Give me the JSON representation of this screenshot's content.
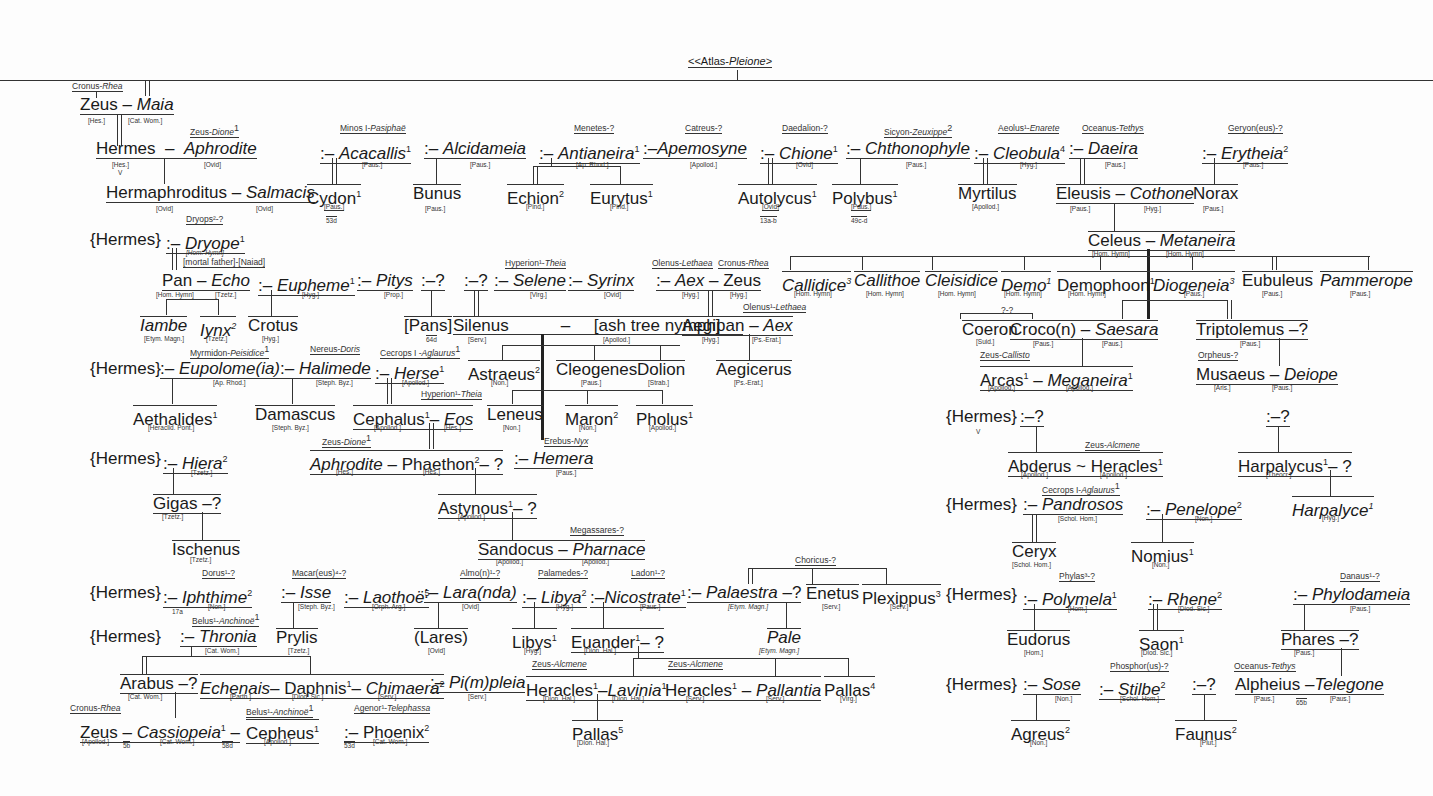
{
  "title": {
    "prefix": "<<Atlas-",
    "italic": "Pleione",
    "suffix": ">"
  },
  "nodes": {
    "cronus_rhea_1": "Cronus-",
    "rhea_1": "Rhea",
    "zeus_1": "Zeus",
    "maia": "Maia",
    "src_hes_1": "[Hes.]",
    "src_catwom_1": "[Cat. Wom.]",
    "zeus_dione_1": "Zeus-",
    "dione_1": "Dione",
    "hermes": "Hermes",
    "aphrodite_1": "Aphrodite",
    "src_hes_2": "[Hes.]",
    "src_ovid_1": "[Ovid]",
    "v_1": "V",
    "hermaphroditus": "Hermaphroditus",
    "salmacis": "Salmacis",
    "src_ovid_2": "[Ovid]",
    "src_ovid_3": "[Ovid]",
    "minos_pasiphae": "Minos I-",
    "pasiphae": "Pasiphaë",
    "acacallis": "Acacallis",
    "src_paus_1": "[Paus.]",
    "cydon": "Cydon",
    "src_paus_2": "[Paus.]",
    "ref_53d_1": "53d",
    "alcidameia": "Alcidameia",
    "src_paus_3": "[Paus.]",
    "bunus": "Bunus",
    "src_paus_4": "[Paus.]",
    "menetes": "Menetes-?",
    "antianeira": "Antianeira",
    "src_aprhod_1": "[Ap. Rhod.]",
    "echion": "Echion",
    "src_pind_1": "[Pind.]",
    "eurytus": "Eurytus",
    "src_pind_2": "[Pind.]",
    "catreus": "Catreus-?",
    "apemosyne": "Apemosyne",
    "src_apollod_1": "[Apollod.]",
    "daedalion": "Daedalion-?",
    "chione": "Chione",
    "src_ovid_4": "[Ovid]",
    "autolycus": "Autolycus",
    "src_ovid_5": "[Ovid]",
    "ref_13ab": "13a-b",
    "sicyon": "Sicyon-",
    "zeuxippe": "Zeuxippe",
    "chthonophyle": "Chthonophyle",
    "src_paus_5": "[Paus.]",
    "polybus": "Polybus",
    "src_paus_6": "[Paus.]",
    "ref_49cd": "49c-d",
    "aeolus": "Aeolus¹-",
    "enarete": "Enarete",
    "cleobula": "Cleobula",
    "src_hyg_1": "[Hyg.]",
    "myrtilus": "Myrtilus",
    "src_apollod_2": "[Apollod.]",
    "oceanus_1": "Oceanus-",
    "tethys_1": "Tethys",
    "daeira": "Daeira",
    "src_paus_7": "[Paus.]",
    "eleusis": "Eleusis",
    "cothone": "Cothone",
    "src_paus_8": "[Paus.]",
    "src_hyg_2": "[Hyg.]",
    "geryon": "Geryon(eus)-?",
    "erytheia": "Erytheia",
    "src_paus_9": "[Paus.]",
    "norax": "Norax",
    "src_paus_10": "[Paus.]",
    "celeus": "Celeus",
    "metaneira": "Metaneira",
    "src_homhym_1": "[Hom. Hymn]",
    "src_homhym_2": "[Hom. Hymn]",
    "callidice": "Callidice",
    "callithoe": "Callithoe",
    "cleisidice": "Cleisidice",
    "demo": "Demo",
    "demophoon": "Demophoon",
    "diogeneia": "Diogeneia",
    "eubuleus": "Eubuleus",
    "pammerope": "Pammerope",
    "src_homhym_3": "[Hom. Hymn]",
    "src_homhym_4": "[Hom. Hymn]",
    "src_homhym_5": "[Hom. Hymn]",
    "src_homhym_6": "[Hom. Hymn]",
    "src_homhym_7": "[Hom. Hymn]",
    "src_paus_11": "[Paus.]",
    "src_paus_12": "[Paus.]",
    "src_paus_13": "[Paus.]",
    "unk_pair": "?-?",
    "coeron": "Coeron",
    "src_suid": "[Suid.]",
    "croco": "Croco(n)",
    "saesara": "Saesara",
    "src_paus_14": "[Paus.]",
    "src_paus_15": "[Paus.]",
    "triptolemus": "Triptolemus",
    "q_1": "?",
    "src_paus_16": "[Paus.]",
    "zeus_callisto": "Zeus-",
    "callisto": "Callisto",
    "arcas": "Arcas",
    "meganeira": "Meganeira",
    "src_apollod_3": "[Apollod.]",
    "src_apollod_4": "[Apollod.]",
    "orpheus": "Orpheus-?",
    "musaeus": "Musaeus",
    "deiope": "Deiope",
    "src_aris": "[Aris.]",
    "src_paus_17": "[Paus.]",
    "hermes_b1": "{Hermes}",
    "dryops": "Dryops²-?",
    "dryope": "Dryope",
    "src_homhym_8": "[Hom. Hymn]",
    "mortal_naiad": "[mortal father]-[Naiad]",
    "pan": "Pan",
    "echo": "Echo",
    "src_homhym_9": "[Hom. Hymn]",
    "src_tzetz_1": "[Tzetz.]",
    "iambe": "Iambe",
    "src_etym_1": "[Etym. Magn.]",
    "iynx": "Iynx",
    "src_tzetz_2": "[Tzetz.]",
    "eupheme": "Eupheme",
    "src_hyg_3": "[Hyg.]",
    "crotus": "Crotus",
    "src_hyg_4": "[Hyg.]",
    "pitys": "Pitys",
    "src_prop": "[Prop.]",
    "q_2": "?",
    "pans": "[Pans]",
    "ref_64d": "64d",
    "q_3": "?",
    "hyperion_1": "Hyperion¹-",
    "theia_1": "Theia",
    "selene": "Selene",
    "src_virg_1": "[Virg.]",
    "syrinx": "Syrinx",
    "src_ovid_6": "[Ovid]",
    "silenus": "Silenus",
    "src_serv_1": "[Serv.]",
    "ash_nymph": "[ash tree nymph]",
    "src_apollod_5": "[Apollod.]",
    "olenus_1": "Olenus-",
    "lethaea_1": "Lethaea",
    "cronus_rhea_2": "Cronus-",
    "rhea_2": "Rhea",
    "aex_1": "Aex",
    "zeus_2": "Zeus",
    "src_hyg_5": "[Hyg.]",
    "src_hyg_6": "[Hyg.]",
    "olenus_2": "Olenus¹-",
    "lethaea_2": "Lethaea",
    "aegipan": "Aegipan",
    "aex_2": "Aex",
    "src_hyg_7": "[Hyg.]",
    "src_pserat_1": "[Ps.-Erat.]",
    "aegicerus": "Aegicerus",
    "src_pserat_2": "[Ps.-Erat.]",
    "astraeus": "Astraeus",
    "src_non_1": "[Non.]",
    "cleogenes": "Cleogenes",
    "src_paus_18": "[Paus.]",
    "dolion": "Dolion",
    "src_strab": "[Strab.]",
    "leneus": "Leneus",
    "src_non_2": "[Non.]",
    "maron": "Maron",
    "src_non_3": "[Non.]",
    "pholus": "Pholus",
    "src_apollod_6": "[Apollod.]",
    "hermes_b2": "{Hermes}",
    "myrmidon": "Myrmidon-",
    "peisidice": "Peisidice",
    "eupolomeia": "Eupolome(ia)",
    "src_aprhod_2": "[Ap. Rhod.]",
    "nereus": "Nereus-",
    "doris": "Doris",
    "halimede": "Halimede",
    "src_stephbyz_1": "[Steph. Byz.]",
    "cecrops_1": "Cecrops I -",
    "aglaurus_1": "Aglaurus",
    "herse": "Herse",
    "src_apollod_7": "[Apollod.]",
    "aethalides": "Aethalides",
    "src_heraclid": "[Heraclid. Pont.]",
    "damascus": "Damascus",
    "src_stephbyz_2": "[Steph. Byz.]",
    "hyperion_2": "Hyperion¹-",
    "theia_2": "Theia",
    "cephalus": "Cephalus",
    "eos": "Eos",
    "src_apollod_8": "[Apollod.]",
    "src_hes_3": "[Hes.]",
    "hermes_b3": "{Hermes}",
    "hiera": "Hiera",
    "src_tzetz_3": "[Tzetz.]",
    "zeus_dione_2": "Zeus-",
    "dione_2": "Dione",
    "aphrodite_2": "Aphrodite",
    "phaethon": "Phaethon",
    "q_4": "?",
    "src_hes_4": "[Hes.]",
    "src_hes_5": "[Hes.]",
    "erebus": "Erebus-",
    "nyx": "Nyx",
    "hemera": "Hemera",
    "src_paus_19": "[Paus.]",
    "gigas": "Gigas",
    "q_5": "?",
    "src_tzetz_4": "[Tzetz.]",
    "ischenus": "Ischenus",
    "src_tzetz_5": "[Tzetz.]",
    "astynous": "Astynous",
    "q_6": "?",
    "src_apollod_9": "[Apollod.]",
    "megassares": "Megassares-?",
    "sandocus": "Sandocus",
    "pharnace": "Pharnace",
    "src_apollod_10": "[Apollod.]",
    "src_apollod_11": "[Apollod.]",
    "hermes_b4": "{Hermes}",
    "dorus": "Dorus¹-?",
    "iphthime": "Iphthime",
    "src_non_4": "[Non.]",
    "ref_17a": "17a",
    "macareus": "Macar(eus)⁴-?",
    "isse": "Isse",
    "src_stephbyz_3": "[Steph. Byz.]",
    "laothoe": "Laothoë",
    "src_orpharg": "[Orph. Arg.]",
    "almon": "Almo(n)¹-?",
    "larunda": "Lara(nda)",
    "src_ovid_7": "[Ovid]",
    "palamedes": "Palamedes-?",
    "libya": "Libya",
    "src_hyg_8": "[Hyg.]",
    "ladon": "Ladon¹-?",
    "nicostrate": "Nicostrate",
    "src_paus_20": "[Paus.]",
    "choricus": "Choricus-?",
    "palaestra": "Palaestra",
    "q_7": "?",
    "src_etym_2": "[Etym. Magn.]",
    "enetus": "Enetus",
    "src_serv_2": "[Serv.]",
    "plexippus": "Plexippus",
    "src_serv_3": "[Serv.]",
    "hermes_b5": "{Hermes}",
    "belus_1": "Belus¹-",
    "anchinoe_1": "Anchinoë",
    "thronia": "Thronia",
    "src_catwom_2": "[Cat. Wom.]",
    "prylis": "Prylis",
    "src_tzetz_6": "[Tzetz.]",
    "lares": "(Lares)",
    "src_ovid_8": "[Ovid]",
    "libys": "Libys",
    "src_hyg_9": "[Hyg.]",
    "euander": "Euander",
    "q_8": "?",
    "src_dionhal_1": "[Dion. Hal.]",
    "pale": "Pale",
    "src_etym_3": "[Etym. Magn.]",
    "arabus": "Arabus",
    "q_9": "?",
    "src_catwom_3": "[Cat. Wom.]",
    "echenais": "Echenais",
    "src_parth": "[Parth.]",
    "daphnis": "Daphnis",
    "src_diodsic_1": "[Diod. Sic.]",
    "chimaera": "Chimaera",
    "src_serv_4": "[Serv.]",
    "pimpleia": "Pi(m)pleia",
    "src_serv_5": "[Serv.]",
    "zeus_alcmene_1": "Zeus-",
    "alcmene_1": "Alcmene",
    "heracles_1": "Heracles",
    "lavinia": "Lavinia",
    "src_dionhal_2": "[Dion. Hal.]",
    "src_dionhal_3": "[Dion. Hal.]",
    "zeus_alcmene_2": "Zeus-",
    "alcmene_2": "Alcmene",
    "heracles_2": "Heracles",
    "pallantia": "Pallantia",
    "src_serv_6": "[Serv.]",
    "src_serv_7": "[Serv.]",
    "pallas_4": "Pallas",
    "src_virg_2": "[Virg.]",
    "pallas_5": "Pallas",
    "src_dionhal_4": "[Dion. Hal.]",
    "cronus_rhea_3": "Cronus-",
    "rhea_3": "Rhea",
    "zeus_3": "Zeus",
    "cassiopeia": "Cassiopeia",
    "src_apollod_12": "[Apollod.]",
    "src_catwom_4": "[Cat. Wom.]",
    "ref_5b": "5b",
    "ref_58d": "58d",
    "belus_2": "Belus¹-",
    "anchinoe_2": "Anchinoë",
    "cepheus": "Cepheus",
    "src_apollod_13": "[Apollod.]",
    "agenor": "Agenor¹-",
    "telephassa": "Telephassa",
    "phoenix": "Phoenix",
    "src_catwom_5": "[Cat. Wom.]",
    "ref_53d_2": "53d",
    "hermes_b6": "{Hermes}",
    "v_2": "V",
    "q_10": "?",
    "abderus": "Abderus",
    "src_apollod_14": "[Apollod.]",
    "zeus_alcmene_3": "Zeus-",
    "alcmene_3": "Alcmene",
    "heracles_3": "Heracles",
    "src_apollod_15": "[Apollod.]",
    "q_11": "?",
    "harpalycus": "Harpalycus",
    "q_12": "?",
    "src_theocr": "[Theocr.]",
    "harpalyce": "Harpalyce",
    "src_hyg_10": "[Hyg.]",
    "hermes_b7": "{Hermes}",
    "cecrops_2": "Cecrops I-",
    "aglaurus_2": "Aglaurus",
    "pandrosos": "Pandrosos",
    "src_scholhom_1": "[Schol. Hom.]",
    "penelope": "Penelope",
    "src_non_5": "[Non.]",
    "ceryx": "Ceryx",
    "src_scholhom_2": "[Schol. Hom.]",
    "nomius": "Nomius",
    "src_non_6": "[Non.]",
    "hermes_b8": "{Hermes}",
    "phylas": "Phylas³-?",
    "polymela": "Polymela",
    "src_hom_1": "[Hom.]",
    "rhene": "Rhene",
    "src_diodsic_2": "[Diod. Sic.]",
    "danaus": "Danaus¹-?",
    "phylodameia": "Phylodameia",
    "src_paus_21": "[Paus.]",
    "eudorus": "Eudorus",
    "src_hom_2": "[Hom.]",
    "saon": "Saon",
    "src_diodsic_3": "[Diod. Sic.]",
    "phares": "Phares",
    "q_13": "?",
    "src_paus_22": "[Paus.]",
    "hermes_b9": "{Hermes}",
    "sose": "Sose",
    "src_non_7": "[Non.]",
    "phosphorus": "Phosphor(us)-?",
    "stilbe": "Stilbe",
    "src_scholhom_3": "[Schol. Hom.]",
    "q_14": "?",
    "oceanus_2": "Oceanus-",
    "tethys_2": "Tethys",
    "alpheius": "Alpheius",
    "telegone": "Telegone",
    "src_paus_23": "[Paus.]",
    "src_paus_24": "[Paus.]",
    "ref_65b": "65b",
    "agreus": "Agreus",
    "src_non_8": "[Non.]",
    "faunus": "Faunus",
    "src_plut": "[Plut.]"
  },
  "sup": {
    "one": "1",
    "two": "2",
    "three": "3",
    "four": "4",
    "five": "5"
  },
  "sym": {
    "dash": "–",
    "colon_dash": ":–",
    "tilde": "~"
  }
}
